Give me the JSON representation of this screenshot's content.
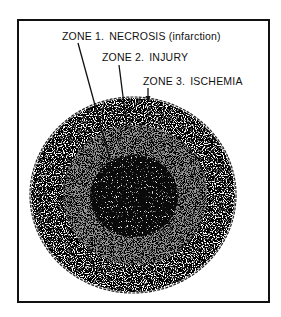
{
  "diagram": {
    "title": "",
    "zones": [
      {
        "id": 1,
        "label_prefix": "ZONE 1.",
        "label_name": "NECROSIS (infarction)",
        "tone": "#0a0a0a"
      },
      {
        "id": 2,
        "label_prefix": "ZONE 2.",
        "label_name": "INJURY",
        "tone": "#7a7a7a"
      },
      {
        "id": 3,
        "label_prefix": "ZONE 3.",
        "label_name": "ISCHEMIA",
        "tone": "#e4e4e4"
      }
    ],
    "colors": {
      "ink": "#111111",
      "background": "#ffffff"
    }
  }
}
